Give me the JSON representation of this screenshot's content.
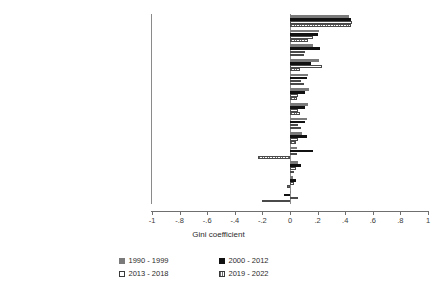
{
  "chart": {
    "type": "bar",
    "orientation": "horizontal",
    "title": "",
    "xlabel": "Gini coefficient",
    "ylabel": "",
    "xlim": [
      -1,
      1
    ],
    "xticks": [
      "-1",
      "-.8",
      "-.6",
      "-.4",
      "-.2",
      "0",
      ".2",
      ".4",
      ".6",
      ".8",
      "1"
    ],
    "xtick_values": [
      -1,
      -0.8,
      -0.6,
      -0.4,
      -0.2,
      0,
      0.2,
      0.4,
      0.6,
      0.8,
      1
    ],
    "grid": false,
    "legend_position": "bottom-center"
  },
  "chart_data": {
    "type": "bar",
    "title": "",
    "xlabel": "Gini coefficient",
    "ylabel": "",
    "xlim": [
      -1,
      1
    ],
    "grid": false,
    "legend_position": "bottom",
    "categories": [
      "Mining",
      "Wholesale Trade",
      "Ag, Forestry, Fishing",
      "Manufacturing",
      "Public Wastewater Treatment",
      "Electric, Gas, Sanitary Services",
      "Retail Trade",
      "All",
      "Transpo and Comms",
      "Finance, Insurance, Real Estate",
      "Services",
      "Public Administration",
      "Construction"
    ],
    "series": [
      {
        "name": "1990 - 1999",
        "color": "#7a7a7a",
        "values": [
          0.43,
          0.21,
          0.17,
          0.21,
          0.13,
          0.14,
          0.13,
          0.12,
          0.09,
          0.05,
          0.06,
          0.02,
          0.01
        ]
      },
      {
        "name": "2000 - 2012",
        "color": "#111111",
        "values": [
          0.44,
          0.2,
          0.22,
          0.15,
          0.12,
          0.11,
          0.11,
          0.11,
          0.12,
          0.17,
          0.08,
          0.04,
          -0.04
        ]
      },
      {
        "name": "2013 - 2018",
        "color": "#ffffff",
        "values": [
          0.45,
          0.17,
          0.11,
          0.23,
          0.08,
          0.06,
          0.06,
          0.06,
          0.06,
          0.05,
          0.04,
          0.03,
          0.06
        ]
      },
      {
        "name": "2019 - 2022",
        "color": "#ffffff",
        "values": [
          0.44,
          0.13,
          0.1,
          0.07,
          0.1,
          0.05,
          0.07,
          0.08,
          0.04,
          -0.23,
          0.03,
          -0.02,
          -0.2
        ]
      }
    ]
  },
  "legend": {
    "items": [
      {
        "label": "1990 - 1999",
        "key": "s1990"
      },
      {
        "label": "2000 - 2012",
        "key": "s2000"
      },
      {
        "label": "2013 - 2018",
        "key": "s2013"
      },
      {
        "label": "2019 - 2022",
        "key": "s2019"
      }
    ]
  }
}
